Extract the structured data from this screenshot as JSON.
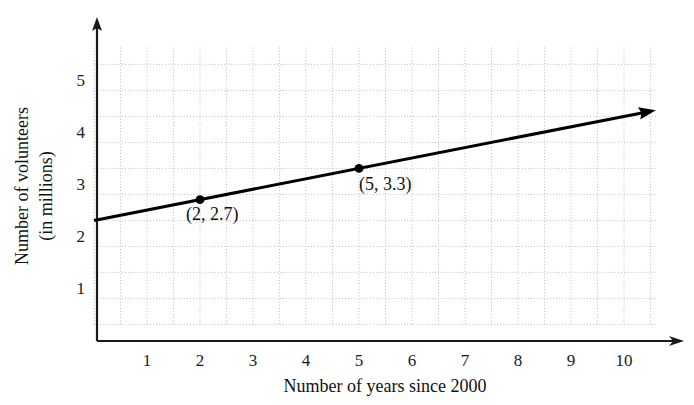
{
  "chart_data": {
    "type": "line",
    "title": "",
    "xlabel": "Number of years since 2000",
    "ylabel_line1": "Number of volunteers",
    "ylabel_line2": "(in millions)",
    "xlim": [
      0,
      10.6
    ],
    "ylim": [
      0,
      5.65
    ],
    "xticks": [
      1,
      2,
      3,
      4,
      5,
      6,
      7,
      8,
      9,
      10
    ],
    "xtick_labels": [
      "1",
      "2",
      "3",
      "4",
      "5",
      "6",
      "7",
      "8",
      "9",
      "10"
    ],
    "yticks": [
      1,
      2,
      3,
      4,
      5
    ],
    "ytick_labels": [
      "1",
      "2",
      "3",
      "4",
      "5"
    ],
    "grid": true,
    "grid_style": "dotted",
    "grid_minor_step_x": 0.5,
    "grid_minor_step_y": 0.5,
    "legend": null,
    "axis_arrows": true,
    "line_color": "#000000",
    "grid_color": "#bdbdbd",
    "axis_color": "#1a1a1a",
    "series": [
      {
        "name": "volunteers trend line",
        "type": "line",
        "slope": 0.2,
        "intercept": 2.3,
        "x_start": 0,
        "y_start": 2.3,
        "x_end": 10.6,
        "y_end": 4.42,
        "arrow_end": true,
        "points": [
          {
            "x": 2,
            "y": 2.7,
            "label": "(2, 2.7)"
          },
          {
            "x": 5,
            "y": 3.3,
            "label": "(5, 3.3)"
          }
        ]
      }
    ]
  },
  "labels": {
    "point_1": "(2, 2.7)",
    "point_2": "(5, 3.3)",
    "x_axis_title": "Number of years since 2000",
    "y_axis_title_line1": "Number of volunteers",
    "y_axis_title_line2": "(in millions)"
  }
}
